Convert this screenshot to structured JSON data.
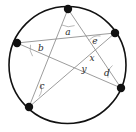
{
  "figure": {
    "background_color": "#ffffff",
    "circle_color": "#111111",
    "chord_color": "#8a8a8a",
    "vertex_color": "#111111",
    "label_color": "#2b2b2b",
    "circle": {
      "cx": 67.5,
      "cy": 65,
      "r": 58.5
    },
    "vertices": [
      {
        "name": "top",
        "x": 68,
        "y": 9
      },
      {
        "name": "upper-right",
        "x": 115,
        "y": 33
      },
      {
        "name": "lower-right",
        "x": 121,
        "y": 88
      },
      {
        "name": "lower-left",
        "x": 29,
        "y": 107
      },
      {
        "name": "left",
        "x": 17,
        "y": 43
      }
    ],
    "chords": [
      {
        "from": "top",
        "to": "lower-right"
      },
      {
        "from": "top",
        "to": "lower-left"
      },
      {
        "from": "upper-right",
        "to": "lower-left"
      },
      {
        "from": "upper-right",
        "to": "left"
      },
      {
        "from": "lower-right",
        "to": "left"
      }
    ],
    "angle_labels": [
      {
        "id": "a",
        "text": "a",
        "x": 68,
        "y": 32
      },
      {
        "id": "b",
        "text": "b",
        "x": 41,
        "y": 48
      },
      {
        "id": "c",
        "text": "c",
        "x": 42,
        "y": 86
      },
      {
        "id": "d",
        "text": "d",
        "x": 107,
        "y": 73
      },
      {
        "id": "e",
        "text": "e",
        "x": 95,
        "y": 41
      },
      {
        "id": "x",
        "text": "x",
        "x": 92,
        "y": 58
      },
      {
        "id": "y",
        "text": "y",
        "x": 84,
        "y": 69
      }
    ],
    "angle_arcs": [
      {
        "id": "arc-a",
        "d": "M 62.0 25.0 A 15 15 0 0 0 74.6 25.6"
      },
      {
        "id": "arc-b",
        "d": "M 30.5 44.8 A 14 14 0 0 0 32.6 56.2"
      },
      {
        "id": "arc-c",
        "d": "M 39.0 96.5 A 13 13 0 0 0 40.5 83.8"
      },
      {
        "id": "arc-d",
        "d": "M 112.5 65.5 A 13 13 0 0 0 108.0 77.8"
      },
      {
        "id": "arc-e",
        "d": "M 100.5 36.0 A 12 12 0 0 0 89.0 40.5"
      }
    ]
  }
}
